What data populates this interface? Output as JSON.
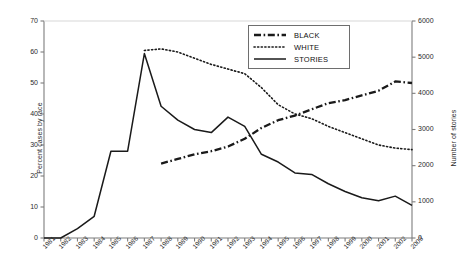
{
  "chart_data": {
    "type": "line",
    "title": "",
    "xlabel": "",
    "ylabel": "Percent cases by race",
    "y2label": "Number of stories",
    "x": [
      1981,
      1982,
      1983,
      1984,
      1985,
      1986,
      1987,
      1988,
      1989,
      1990,
      1991,
      1992,
      1993,
      1994,
      1995,
      1996,
      1997,
      1998,
      1999,
      2000,
      2001,
      2002,
      2003
    ],
    "xticklabels": [
      "1981",
      "1982",
      "1983",
      "1984",
      "1985",
      "1986",
      "1987",
      "1988",
      "1989",
      "1990",
      "1991",
      "1992",
      "1993",
      "1994",
      "1995",
      "1996",
      "1997",
      "1998",
      "1999",
      "2000",
      "2001",
      "2002",
      "2003"
    ],
    "ylim": [
      0,
      70
    ],
    "yticks": [
      0,
      10,
      20,
      30,
      40,
      50,
      60,
      70
    ],
    "yticklabels": [
      "0",
      "10",
      "20",
      "30",
      "40",
      "50",
      "60",
      "70"
    ],
    "y2lim": [
      0,
      6000
    ],
    "y2ticks": [
      0,
      1000,
      2000,
      3000,
      4000,
      5000,
      6000
    ],
    "y2ticklabels": [
      "0",
      "1000",
      "2000",
      "3000",
      "4000",
      "5000",
      "6000"
    ],
    "grid": false,
    "legend_position": "upper-center-right",
    "series": [
      {
        "name": "BLACK",
        "axis": "left",
        "style": "dash-dot",
        "color": "#1a1a1a",
        "x": [
          1988,
          1989,
          1990,
          1991,
          1992,
          1993,
          1994,
          1995,
          1996,
          1997,
          1998,
          1999,
          2000,
          2001,
          2002,
          2003
        ],
        "values": [
          24.0,
          25.5,
          27.0,
          28.0,
          29.5,
          32.0,
          35.5,
          38.0,
          39.5,
          41.5,
          43.5,
          44.5,
          46.0,
          47.5,
          50.5,
          50.0
        ]
      },
      {
        "name": "WHITE",
        "axis": "left",
        "style": "dotted",
        "color": "#1a1a1a",
        "x": [
          1987,
          1988,
          1989,
          1990,
          1991,
          1992,
          1993,
          1994,
          1995,
          1996,
          1997,
          1998,
          1999,
          2000,
          2001,
          2002,
          2003
        ],
        "values": [
          60.5,
          61.0,
          60.0,
          58.0,
          56.0,
          54.5,
          53.0,
          48.5,
          43.0,
          40.0,
          38.5,
          36.0,
          34.0,
          32.0,
          30.0,
          29.0,
          28.5
        ]
      },
      {
        "name": "STORIES",
        "axis": "right",
        "style": "solid",
        "color": "#1a1a1a",
        "x": [
          1981,
          1982,
          1983,
          1984,
          1985,
          1986,
          1987,
          1988,
          1989,
          1990,
          1991,
          1992,
          1993,
          1994,
          1995,
          1996,
          1997,
          1998,
          1999,
          2000,
          2001,
          2002,
          2003
        ],
        "values_right_axis": [
          0,
          0,
          250,
          600,
          2400,
          2400,
          5100,
          3650,
          3250,
          3000,
          2900,
          3350,
          3100,
          2300,
          2100,
          1800,
          1750,
          1500,
          1300,
          1100,
          1050,
          1150,
          900
        ],
        "values_left_axis": [
          0.0,
          0.0,
          3.0,
          7.0,
          28.0,
          28.0,
          59.5,
          42.5,
          38.0,
          35.0,
          34.0,
          39.0,
          36.0,
          27.0,
          24.5,
          21.0,
          20.5,
          17.5,
          15.0,
          13.0,
          12.0,
          13.5,
          10.5
        ]
      }
    ]
  },
  "legend": {
    "items": [
      {
        "label": "BLACK",
        "style": "dash-dot"
      },
      {
        "label": "WHITE",
        "style": "dotted"
      },
      {
        "label": "STORIES",
        "style": "solid"
      }
    ]
  },
  "axes": {
    "left_title": "Percent cases by race",
    "right_title": "Number of stories"
  }
}
